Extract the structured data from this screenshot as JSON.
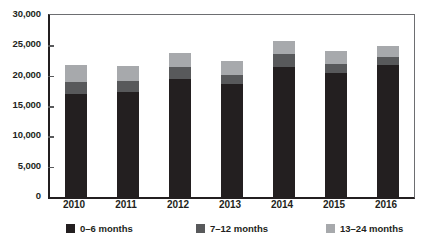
{
  "chart_data": {
    "type": "bar",
    "subtype": "stacked-vertical",
    "title": "",
    "subtitle": "",
    "xlabel": "",
    "ylabel": "",
    "categories": [
      "2010",
      "2011",
      "2012",
      "2013",
      "2014",
      "2015",
      "2016"
    ],
    "series": [
      {
        "name": "0–6 months",
        "color": "#231f20",
        "values": [
          17000,
          17300,
          19500,
          18700,
          21500,
          20400,
          21700
        ]
      },
      {
        "name": "7–12 months",
        "color": "#58595b",
        "values": [
          2000,
          1800,
          1900,
          1400,
          2000,
          1600,
          1400
        ]
      },
      {
        "name": "13–24 months",
        "color": "#a7a9ac",
        "values": [
          2800,
          2500,
          2300,
          2300,
          2200,
          2000,
          1800
        ]
      }
    ],
    "totals": [
      21800,
      21600,
      23700,
      22400,
      25700,
      24000,
      24900
    ],
    "ylim": [
      0,
      30000
    ],
    "ytick_values": [
      0,
      5000,
      10000,
      15000,
      20000,
      25000,
      30000
    ],
    "ytick_labels": [
      "0",
      "5,000",
      "10,000",
      "15,000",
      "20,000",
      "25,000",
      "30,000"
    ],
    "grid": false,
    "legend_position": "bottom"
  },
  "axes": {
    "y": {
      "ticks": [
        {
          "value": 30000,
          "label": "30,000"
        },
        {
          "value": 25000,
          "label": "25,000"
        },
        {
          "value": 20000,
          "label": "20,000"
        },
        {
          "value": 15000,
          "label": "15,000"
        },
        {
          "value": 10000,
          "label": "10,000"
        },
        {
          "value": 5000,
          "label": "5,000"
        },
        {
          "value": 0,
          "label": "0"
        }
      ]
    },
    "x": {
      "ticks": [
        {
          "label": "2010"
        },
        {
          "label": "2011"
        },
        {
          "label": "2012"
        },
        {
          "label": "2013"
        },
        {
          "label": "2014"
        },
        {
          "label": "2015"
        },
        {
          "label": "2016"
        }
      ]
    }
  },
  "legend": {
    "items": [
      {
        "label": "0–6 months",
        "color": "#231f20"
      },
      {
        "label": "7–12 months",
        "color": "#58595b"
      },
      {
        "label": "13–24 months",
        "color": "#a7a9ac"
      }
    ]
  },
  "colors": {
    "axis": "#231f20",
    "frame_light": "#6d6e71",
    "background": "#ffffff"
  }
}
